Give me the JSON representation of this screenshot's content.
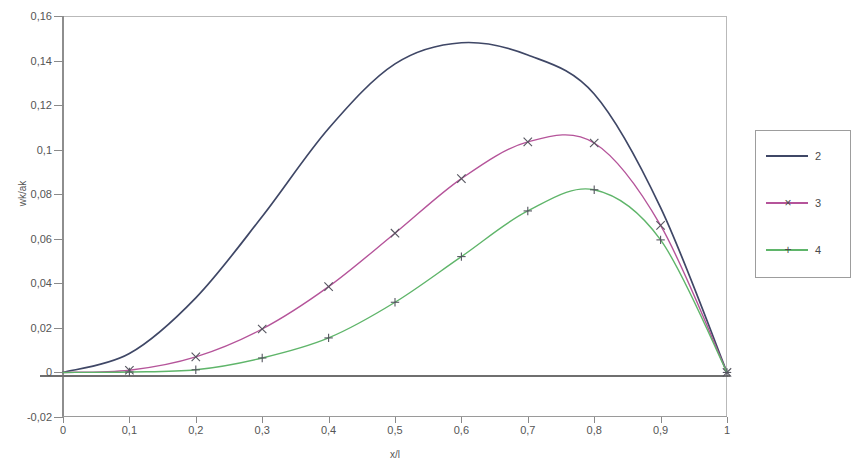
{
  "chart_data": {
    "type": "line",
    "title": "",
    "xlabel": "x/l",
    "ylabel": "wk/ak",
    "xlim": [
      0,
      1
    ],
    "ylim": [
      -0.02,
      0.16
    ],
    "grid": false,
    "legend_position": "right",
    "x_ticks": [
      "0",
      "0,1",
      "0,2",
      "0,3",
      "0,4",
      "0,5",
      "0,6",
      "0,7",
      "0,8",
      "0,9",
      "1"
    ],
    "x_tick_values": [
      0,
      0.1,
      0.2,
      0.3,
      0.4,
      0.5,
      0.6,
      0.7,
      0.8,
      0.9,
      1
    ],
    "y_ticks": [
      "0,16",
      "0,14",
      "0,12",
      "0,1",
      "0,08",
      "0,06",
      "0,04",
      "0,02",
      "0",
      "-0,02"
    ],
    "y_tick_values": [
      0.16,
      0.14,
      0.12,
      0.1,
      0.08,
      0.06,
      0.04,
      0.02,
      0,
      -0.02
    ],
    "x": [
      0,
      0.1,
      0.2,
      0.3,
      0.4,
      0.5,
      0.6,
      0.7,
      0.8,
      0.9,
      1
    ],
    "series": [
      {
        "name": "2",
        "color": "#3f4766",
        "marker": "none",
        "values": [
          0,
          0.0085,
          0.0335,
          0.07,
          0.1095,
          0.1385,
          0.148,
          0.1425,
          0.125,
          0.074,
          0
        ]
      },
      {
        "name": "3",
        "color": "#b5549a",
        "marker": "x",
        "values": [
          0,
          0.001,
          0.007,
          0.0195,
          0.0385,
          0.0625,
          0.087,
          0.1035,
          0.103,
          0.066,
          0
        ]
      },
      {
        "name": "4",
        "color": "#5fb56a",
        "marker": "+",
        "values": [
          0,
          0.0002,
          0.0012,
          0.0065,
          0.0155,
          0.0315,
          0.052,
          0.0725,
          0.082,
          0.0595,
          0
        ]
      }
    ]
  },
  "legend": {
    "entries": [
      {
        "label": "2",
        "color": "#3f4766",
        "marker": ""
      },
      {
        "label": "3",
        "color": "#b5549a",
        "marker": "×"
      },
      {
        "label": "4",
        "color": "#5fb56a",
        "marker": "+"
      }
    ]
  },
  "axes": {
    "y_title": "wk/ak",
    "x_title": "x/l"
  }
}
